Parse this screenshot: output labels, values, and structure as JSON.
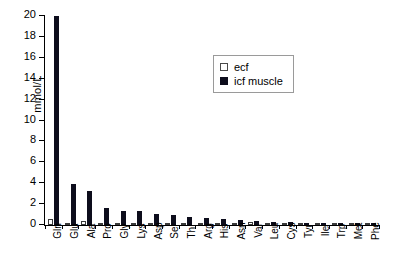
{
  "chart_data": {
    "type": "bar",
    "title": "",
    "subtitle": "",
    "xlabel": "",
    "ylabel": "mmol/L",
    "ylim": [
      0,
      20
    ],
    "ytick_step": 2,
    "yticks": [
      0,
      2,
      4,
      6,
      8,
      10,
      12,
      14,
      16,
      18,
      20
    ],
    "ytick_labels": [
      "0",
      "2",
      "4",
      "6",
      "8",
      "10",
      "12",
      "14",
      "16",
      "18",
      "20"
    ],
    "grid": false,
    "legend_position": "top-right-inset",
    "categories": [
      "Gln",
      "Glu",
      "Ala",
      "Pro",
      "Gly",
      "Lys",
      "Asp",
      "Ser",
      "Thr",
      "Arg",
      "His",
      "Asn",
      "Val",
      "Leu",
      "Cys",
      "Tyr",
      "Ile",
      "Trp",
      "Met",
      "Phe"
    ],
    "series": [
      {
        "name": "ecf",
        "color": "#ffffff",
        "edge_color": "#3a3a3a",
        "values": [
          0.6,
          0.1,
          0.35,
          0.12,
          0.22,
          0.18,
          0.05,
          0.12,
          0.15,
          0.1,
          0.08,
          0.05,
          0.25,
          0.18,
          0.1,
          0.07,
          0.09,
          0.06,
          0.05,
          0.06
        ]
      },
      {
        "name": "icf muscle",
        "color": "#0d0d1c",
        "edge_color": "#0d0d1c",
        "values": [
          20.0,
          3.9,
          3.25,
          1.6,
          1.35,
          1.3,
          1.05,
          0.95,
          0.75,
          0.68,
          0.55,
          0.5,
          0.35,
          0.3,
          0.25,
          0.22,
          0.2,
          0.18,
          0.16,
          0.14
        ]
      }
    ]
  },
  "legend": {
    "items": [
      {
        "label": "ecf",
        "swatch": "open-square"
      },
      {
        "label": "icf muscle",
        "swatch": "filled-square"
      }
    ]
  },
  "axes": {
    "y_title": "mmol/L"
  }
}
